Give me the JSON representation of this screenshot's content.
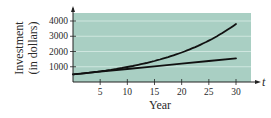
{
  "chart_data": {
    "type": "line",
    "title": "",
    "xlabel": "Year",
    "ylabel": "Investment\n(in dollars)",
    "ylabel_lines": [
      "Investment",
      "(in dollars)"
    ],
    "x_axis_variable": "t",
    "xlim": [
      0,
      33
    ],
    "ylim": [
      0,
      4500
    ],
    "x_ticks": [
      5,
      10,
      15,
      20,
      25,
      30
    ],
    "x_tick_labels": [
      "5",
      "10",
      "15",
      "20",
      "25",
      "30"
    ],
    "y_ticks": [
      1000,
      2000,
      3000,
      4000
    ],
    "y_tick_labels": [
      "1000",
      "2000",
      "3000",
      "4000"
    ],
    "grid": true,
    "legend": null,
    "background_color": "#a9cfc3",
    "line_color": "#111111",
    "series": [
      {
        "name": "Compound growth",
        "x": [
          0,
          5,
          10,
          15,
          20,
          25,
          30
        ],
        "values": [
          500,
          701,
          984,
          1380,
          1935,
          2714,
          3806
        ]
      },
      {
        "name": "Linear growth",
        "x": [
          0,
          5,
          10,
          15,
          20,
          25,
          30
        ],
        "values": [
          500,
          675,
          850,
          1025,
          1200,
          1375,
          1550
        ]
      }
    ]
  }
}
